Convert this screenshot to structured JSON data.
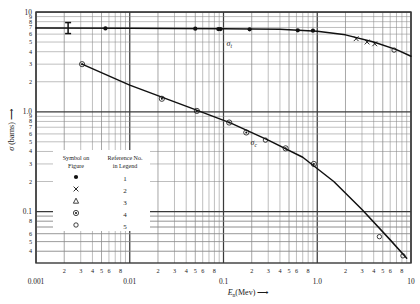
{
  "chart_data": {
    "type": "line",
    "title": "",
    "xlabel": "Eₙ(Mev)",
    "ylabel": "σ (barns)",
    "xscale": "log",
    "yscale": "log",
    "xlim": [
      0.001,
      10
    ],
    "ylim": [
      0.03,
      10
    ],
    "grid": true,
    "x_decade_labels": [
      "0.001",
      "0.01",
      "0.1",
      "1.0",
      "10"
    ],
    "x_minor_labels": [
      "2",
      "3",
      "4",
      "5",
      "6",
      "8"
    ],
    "y_decade_labels": [
      "10",
      "1.0",
      "0.1"
    ],
    "y_minor_labels": [
      "9",
      "8",
      "7",
      "6",
      "5",
      "4",
      "3",
      "2"
    ],
    "y_low_minor_labels": [
      "8",
      "6",
      "5",
      "4",
      "3"
    ],
    "series": [
      {
        "name": "σ_t",
        "label": "σₜ",
        "style": "solid",
        "points": [
          {
            "x": 0.0055,
            "y": 6.85,
            "marker": "filled-circle"
          },
          {
            "x": 0.05,
            "y": 6.8,
            "marker": "filled-circle"
          },
          {
            "x": 0.088,
            "y": 6.75,
            "marker": "filled-circle"
          },
          {
            "x": 0.093,
            "y": 6.75,
            "marker": "filled-circle"
          },
          {
            "x": 0.19,
            "y": 6.7,
            "marker": "filled-circle"
          },
          {
            "x": 0.62,
            "y": 6.55,
            "marker": "filled-circle"
          },
          {
            "x": 0.9,
            "y": 6.5,
            "marker": "filled-circle"
          },
          {
            "x": 2.6,
            "y": 5.4,
            "marker": "cross"
          },
          {
            "x": 3.4,
            "y": 5.0,
            "marker": "cross"
          },
          {
            "x": 4.1,
            "y": 4.8,
            "marker": "cross"
          },
          {
            "x": 6.6,
            "y": 4.15,
            "marker": "open-circle"
          }
        ],
        "line": [
          {
            "x": 0.001,
            "y": 6.9
          },
          {
            "x": 0.01,
            "y": 6.88
          },
          {
            "x": 0.1,
            "y": 6.8
          },
          {
            "x": 0.4,
            "y": 6.7
          },
          {
            "x": 1.0,
            "y": 6.4
          },
          {
            "x": 2.0,
            "y": 5.9
          },
          {
            "x": 4.0,
            "y": 5.0
          },
          {
            "x": 7.0,
            "y": 4.2
          },
          {
            "x": 10.0,
            "y": 3.6
          }
        ]
      },
      {
        "name": "σ_c",
        "label": "σc",
        "style": "solid",
        "points": [
          {
            "x": 0.0031,
            "y": 3.0,
            "marker": "circled-dot"
          },
          {
            "x": 0.022,
            "y": 1.35,
            "marker": "circled-dot"
          },
          {
            "x": 0.052,
            "y": 1.02,
            "marker": "circled-dot"
          },
          {
            "x": 0.115,
            "y": 0.78,
            "marker": "circled-dot"
          },
          {
            "x": 0.175,
            "y": 0.62,
            "marker": "circled-dot"
          },
          {
            "x": 0.28,
            "y": 0.52,
            "marker": "open-circle"
          },
          {
            "x": 0.46,
            "y": 0.43,
            "marker": "circled-dot"
          },
          {
            "x": 0.92,
            "y": 0.3,
            "marker": "circled-dot"
          },
          {
            "x": 4.6,
            "y": 0.056,
            "marker": "open-circle"
          },
          {
            "x": 8.2,
            "y": 0.036,
            "marker": "open-circle"
          }
        ],
        "line": [
          {
            "x": 0.0031,
            "y": 3.0
          },
          {
            "x": 0.01,
            "y": 1.85
          },
          {
            "x": 0.05,
            "y": 1.05
          },
          {
            "x": 0.12,
            "y": 0.77
          },
          {
            "x": 0.3,
            "y": 0.52
          },
          {
            "x": 0.7,
            "y": 0.35
          },
          {
            "x": 1.5,
            "y": 0.2
          },
          {
            "x": 3.0,
            "y": 0.105
          },
          {
            "x": 6.0,
            "y": 0.052
          },
          {
            "x": 9.0,
            "y": 0.034
          }
        ]
      }
    ],
    "annotations": [
      {
        "name": "error-bar-marker",
        "text": "I",
        "x": 0.0022,
        "y": 6.9
      }
    ]
  },
  "legend": {
    "header_col1_line1": "Symbol on",
    "header_col1_line2": "Figure",
    "header_col2_line1": "Reference No.",
    "header_col2_line2": "in Legend",
    "rows": [
      {
        "symbol": "filled-circle",
        "ref": "1"
      },
      {
        "symbol": "cross",
        "ref": "2"
      },
      {
        "symbol": "triangle",
        "ref": "3"
      },
      {
        "symbol": "circled-dot",
        "ref": "4"
      },
      {
        "symbol": "open-circle",
        "ref": "5"
      }
    ]
  },
  "axes": {
    "x_title": "Eₙ(Mev)",
    "y_title": "σ (barns)",
    "arrow": "⟶"
  },
  "labels": {
    "sigma_t": "σ",
    "sigma_t_sub": "t",
    "sigma_c": "σ",
    "sigma_c_sub": "c",
    "x_dec_0": "0.001",
    "x_dec_1": "0.01",
    "x_dec_2": "0.1",
    "x_dec_3": "1.0",
    "x_dec_4": "10",
    "y_dec_10": "10",
    "y_dec_1": "1.0",
    "y_dec_01": "0.1",
    "t2": "2",
    "t3": "3",
    "t4": "4",
    "t5": "5",
    "t6": "6",
    "t8": "8",
    "m9": "9",
    "m8": "8",
    "m7": "7",
    "m6": "6",
    "m5": "5",
    "m4": "4",
    "m3": "3",
    "m2": "2",
    "errbar": "I"
  },
  "colors": {
    "ink": "#1b1b1b",
    "grid_major": "#3a3a3a",
    "grid_minor": "#8a8a8a",
    "curve": "#111111",
    "bg": "#ffffff"
  }
}
